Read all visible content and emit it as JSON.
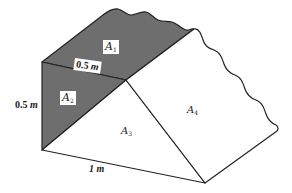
{
  "figure": {
    "type": "prism-cross-section",
    "shaded_color": "#6e6e6e",
    "line_color": "#222222",
    "vertices": {
      "top_left": [
        42,
        62
      ],
      "ridge_mid": [
        126,
        80
      ],
      "bottom_left": [
        42,
        150
      ],
      "bottom_front": [
        205,
        183
      ],
      "right_end": [
        277,
        131
      ],
      "shaded_top_right": [
        193,
        30
      ]
    }
  },
  "labels": {
    "a1": {
      "base": "A",
      "sub": "1"
    },
    "a2": {
      "base": "A",
      "sub": "2"
    },
    "a3": {
      "base": "A",
      "sub": "3"
    },
    "a4": {
      "base": "A",
      "sub": "4"
    }
  },
  "dimensions": {
    "top_edge": {
      "value": "0.5",
      "unit": "m"
    },
    "left_edge": {
      "value": "0.5",
      "unit": "m"
    },
    "bottom_edge": {
      "value": "1",
      "unit": "m"
    }
  }
}
